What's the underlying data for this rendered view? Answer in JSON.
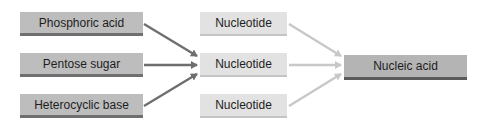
{
  "diagram": {
    "sources": [
      {
        "label": "Phosphoric acid"
      },
      {
        "label": "Pentose sugar"
      },
      {
        "label": "Heterocyclic base"
      }
    ],
    "intermediates": [
      {
        "label": "Nucleotide"
      },
      {
        "label": "Nucleotide"
      },
      {
        "label": "Nucleotide"
      }
    ],
    "target": {
      "label": "Nucleic acid"
    },
    "colors": {
      "source_fill": "#bdbdbd",
      "source_border": "#6f6f6f",
      "intermediate_fill": "#e2e2e2",
      "target_fill": "#b4b4b4",
      "target_border": "#5a5a5a",
      "dark_arrow": "#6e6e6e",
      "light_arrow": "#c8c8c8"
    }
  }
}
